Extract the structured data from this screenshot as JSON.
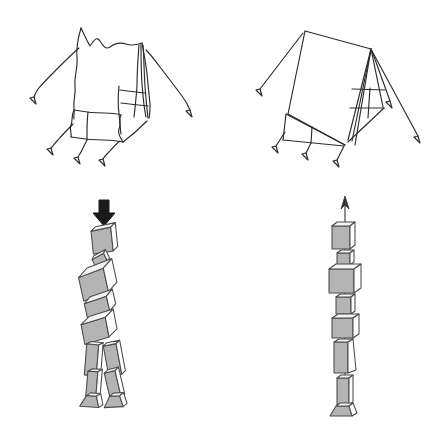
{
  "figure": {
    "title": "Tent and body-segment alignment comparison",
    "background_color": "#ffffff",
    "width": 446,
    "height": 424,
    "panels": [
      {
        "id": "panel-slack-tent",
        "position": "top-left",
        "name": "slack-tent",
        "caption": "",
        "description": "Hand-drawn tent with sagging fabric and slack, wavy guy-lines",
        "guy_line_count": 5,
        "stake_count": 5,
        "line_style": "wavy",
        "stroke_color": "#2b2b2b"
      },
      {
        "id": "panel-taut-tent",
        "position": "top-right",
        "name": "taut-tent",
        "caption": "",
        "description": "Tent with taut fabric and straight, tensioned guy-lines",
        "guy_line_count": 5,
        "stake_count": 5,
        "line_style": "straight",
        "stroke_color": "#2b2b2b"
      },
      {
        "id": "panel-collapsed-segments",
        "position": "bottom-left",
        "name": "collapsed-body-segments",
        "caption": "",
        "description": "Stack of 3D body-segment blocks misaligned and collapsing under a downward compressive arrow",
        "arrow": {
          "name": "downward-compression-arrow",
          "direction": "down",
          "style": "solid-thick",
          "color": "#1a1a1a"
        },
        "segment_count": 11,
        "segments": [
          {
            "label": "head",
            "rotation": -6
          },
          {
            "label": "neck",
            "rotation": -20
          },
          {
            "label": "thorax",
            "rotation": -12
          },
          {
            "label": "lumbar",
            "rotation": -10
          },
          {
            "label": "pelvis",
            "rotation": -8
          },
          {
            "label": "thigh-left",
            "rotation": 12
          },
          {
            "label": "thigh-right",
            "rotation": -8
          },
          {
            "label": "shank-left",
            "rotation": 10
          },
          {
            "label": "shank-right",
            "rotation": -10
          },
          {
            "label": "foot-left",
            "rotation": 6
          },
          {
            "label": "foot-right",
            "rotation": -4
          }
        ]
      },
      {
        "id": "panel-aligned-segments",
        "position": "bottom-right",
        "name": "aligned-body-segments",
        "caption": "",
        "description": "Body-segment blocks stacked in line along a vertical upward axis arrow",
        "arrow": {
          "name": "upward-axis-arrow",
          "direction": "up",
          "style": "thin-line",
          "color": "#333333"
        },
        "segment_count": 8,
        "segments": [
          {
            "label": "head",
            "rotation": 0
          },
          {
            "label": "neck",
            "rotation": 0
          },
          {
            "label": "thorax",
            "rotation": 0
          },
          {
            "label": "lumbar",
            "rotation": 0
          },
          {
            "label": "pelvis",
            "rotation": 0
          },
          {
            "label": "thigh",
            "rotation": 0
          },
          {
            "label": "shank",
            "rotation": 0
          },
          {
            "label": "foot",
            "rotation": 0
          }
        ]
      }
    ],
    "palette": {
      "outline": "#2b2b2b",
      "block_outline": "#4a4a4a",
      "block_face_front": "#b4b4b4",
      "block_face_top": "#f2f2f2",
      "block_face_side": "#ffffff",
      "arrow_dark": "#1a1a1a",
      "arrow_axis": "#333333",
      "paper": "#ffffff"
    }
  }
}
